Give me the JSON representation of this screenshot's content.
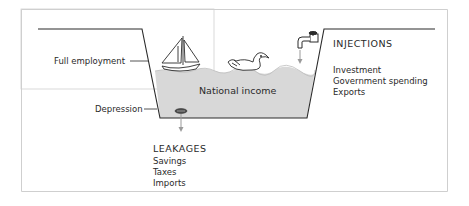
{
  "labels": {
    "full_employment": "Full employment",
    "depression": "Depression",
    "national_income": "National income",
    "injections_title": "INJECTIONS",
    "injections": [
      "Investment",
      "Government spending",
      "Exports"
    ],
    "leakages_title": "LEAKAGES",
    "leakages": [
      "Savings",
      "Taxes",
      "Imports"
    ]
  },
  "icons": {
    "boat": "sailboat-icon",
    "duck": "duck-icon",
    "tap": "tap-icon",
    "drain": "drain-icon"
  },
  "colors": {
    "water": "#d8d8d8",
    "line": "#2a2a2a",
    "arrow": "#9a9a9a",
    "frame": "#cfcfcf"
  }
}
